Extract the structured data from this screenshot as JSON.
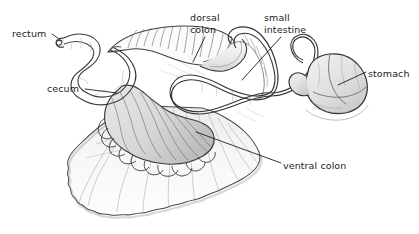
{
  "figure": {
    "style": "graphite pencil and ink line drawing",
    "background_color": "#ffffff",
    "ink_color": "#2b2b2b",
    "leader_line_color": "#222222",
    "label_text_color": "#1d1d1d"
  },
  "labels": {
    "rectum": "rectum",
    "cecum": "cecum",
    "dorsal_colon": "dorsal\ncolon",
    "small_intestine": "small\nintestine",
    "stomach": "stomach",
    "ventral_colon": "ventral colon"
  },
  "structures": [
    {
      "name": "rectum",
      "label": "rectum"
    },
    {
      "name": "cecum",
      "label": "cecum"
    },
    {
      "name": "dorsal-colon",
      "label": "dorsal colon"
    },
    {
      "name": "small-intestine",
      "label": "small intestine"
    },
    {
      "name": "stomach",
      "label": "stomach"
    },
    {
      "name": "ventral-colon",
      "label": "ventral colon"
    }
  ]
}
